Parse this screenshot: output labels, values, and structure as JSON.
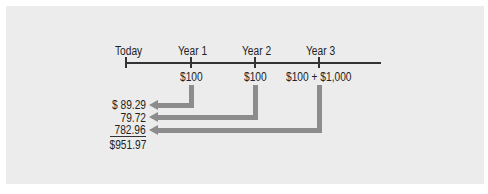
{
  "timeline": {
    "points": [
      {
        "label": "Today",
        "cash_flow": ""
      },
      {
        "label": "Year 1",
        "cash_flow": "$100"
      },
      {
        "label": "Year 2",
        "cash_flow": "$100"
      },
      {
        "label": "Year 3",
        "cash_flow": "$100 + $1,000"
      }
    ]
  },
  "present_values": {
    "items": [
      "$ 89.29",
      "79.72",
      "782.96"
    ],
    "total": "$951.97"
  },
  "colors": {
    "background": "#ececec",
    "arrow": "#8c8c8c",
    "line": "#333333"
  }
}
